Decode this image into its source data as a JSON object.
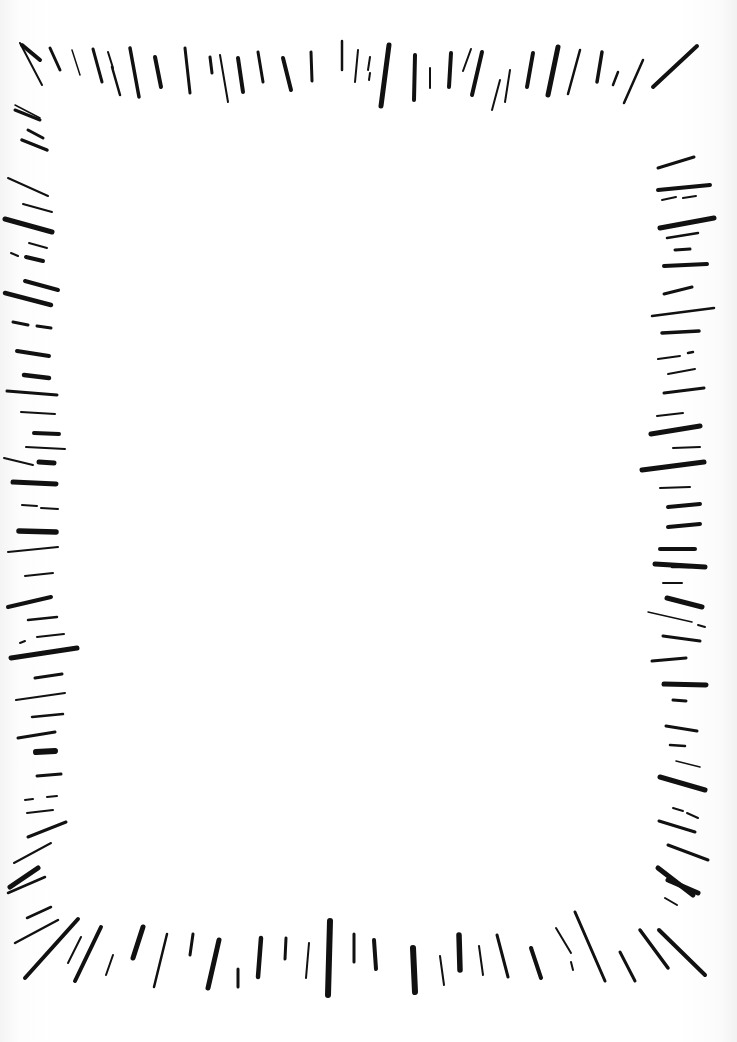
{
  "title": "Hand-drawn radial stroke frame",
  "colors": {
    "ink": "#111111",
    "paper": "#ffffff"
  },
  "frame": {
    "top": [
      [
        22,
        45,
        40,
        60,
        4
      ],
      [
        20,
        43,
        42,
        85,
        2
      ],
      [
        50,
        48,
        60,
        70,
        3
      ],
      [
        72,
        50,
        80,
        75,
        1.5
      ],
      [
        93,
        49,
        102,
        82,
        3
      ],
      [
        108,
        52,
        113,
        68,
        2
      ],
      [
        112,
        67,
        120,
        95,
        2.5
      ],
      [
        130,
        48,
        139,
        97,
        3.5
      ],
      [
        155,
        57,
        161,
        87,
        4
      ],
      [
        185,
        48,
        190,
        93,
        3
      ],
      [
        210,
        57,
        212,
        73,
        3
      ],
      [
        220,
        55,
        228,
        102,
        2
      ],
      [
        238,
        58,
        243,
        92,
        4
      ],
      [
        258,
        52,
        263,
        82,
        3
      ],
      [
        283,
        58,
        291,
        90,
        4
      ],
      [
        311,
        52,
        312,
        81,
        3
      ],
      [
        342,
        41,
        342,
        70,
        2.5
      ],
      [
        358,
        50,
        355,
        82,
        2
      ],
      [
        370,
        57,
        368,
        70,
        2
      ],
      [
        370,
        73,
        369,
        80,
        2
      ],
      [
        389,
        45,
        381,
        106,
        5
      ],
      [
        415,
        55,
        414,
        100,
        4
      ],
      [
        430,
        68,
        430,
        88,
        2
      ],
      [
        451,
        53,
        449,
        87,
        4
      ],
      [
        471,
        49,
        463,
        71,
        2
      ],
      [
        482,
        52,
        472,
        95,
        4
      ],
      [
        500,
        80,
        492,
        110,
        2
      ],
      [
        510,
        70,
        505,
        102,
        2
      ],
      [
        533,
        53,
        527,
        87,
        4
      ],
      [
        558,
        47,
        548,
        95,
        5
      ],
      [
        580,
        50,
        568,
        94,
        2.5
      ],
      [
        602,
        52,
        597,
        82,
        3.5
      ],
      [
        618,
        72,
        613,
        85,
        2.5
      ],
      [
        643,
        60,
        624,
        103,
        2.5
      ],
      [
        697,
        46,
        653,
        87,
        4
      ]
    ],
    "left": [
      [
        15,
        105,
        40,
        118,
        1.5
      ],
      [
        15,
        110,
        40,
        120,
        3
      ],
      [
        28,
        130,
        43,
        138,
        3
      ],
      [
        22,
        140,
        47,
        150,
        3.5
      ],
      [
        8,
        178,
        48,
        196,
        2
      ],
      [
        23,
        204,
        52,
        212,
        2
      ],
      [
        5,
        219,
        52,
        232,
        5
      ],
      [
        29,
        243,
        47,
        248,
        2
      ],
      [
        11,
        253,
        18,
        256,
        2
      ],
      [
        26,
        257,
        43,
        261,
        4
      ],
      [
        25,
        281,
        58,
        290,
        4
      ],
      [
        5,
        293,
        51,
        305,
        4.5
      ],
      [
        13,
        322,
        28,
        325,
        3
      ],
      [
        37,
        326,
        51,
        328,
        3
      ],
      [
        17,
        351,
        49,
        356,
        4
      ],
      [
        24,
        375,
        49,
        378,
        4.5
      ],
      [
        7,
        391,
        57,
        395,
        3
      ],
      [
        21,
        412,
        55,
        414,
        2
      ],
      [
        34,
        433,
        59,
        434,
        4
      ],
      [
        26,
        447,
        65,
        449,
        2
      ],
      [
        4,
        458,
        33,
        465,
        2
      ],
      [
        39,
        462,
        54,
        463,
        5
      ],
      [
        13,
        482,
        56,
        484,
        5
      ],
      [
        22,
        505,
        37,
        506,
        2
      ],
      [
        41,
        508,
        58,
        509,
        2
      ],
      [
        19,
        531,
        56,
        532,
        5.5
      ],
      [
        8,
        552,
        58,
        547,
        2
      ],
      [
        25,
        576,
        53,
        573,
        2
      ],
      [
        8,
        607,
        51,
        597,
        4
      ],
      [
        28,
        620,
        57,
        617,
        2.5
      ],
      [
        20,
        643,
        25,
        641,
        2
      ],
      [
        37,
        637,
        64,
        634,
        2
      ],
      [
        11,
        658,
        77,
        648,
        5
      ],
      [
        35,
        678,
        62,
        674,
        3
      ],
      [
        16,
        700,
        65,
        693,
        2
      ],
      [
        32,
        717,
        63,
        714,
        2.5
      ],
      [
        18,
        738,
        55,
        732,
        3
      ],
      [
        36,
        752,
        55,
        751,
        6
      ],
      [
        37,
        776,
        61,
        774,
        3
      ],
      [
        25,
        800,
        33,
        799,
        2
      ],
      [
        47,
        797,
        57,
        796,
        2
      ],
      [
        27,
        813,
        53,
        810,
        2
      ],
      [
        28,
        837,
        66,
        822,
        3
      ],
      [
        14,
        863,
        51,
        843,
        2
      ],
      [
        10,
        887,
        38,
        868,
        5
      ],
      [
        8,
        893,
        45,
        877,
        2.5
      ],
      [
        27,
        918,
        51,
        907,
        2.5
      ],
      [
        15,
        943,
        58,
        920,
        2.5
      ]
    ],
    "left_bottom": [
      [
        25,
        978,
        78,
        919,
        4
      ],
      [
        68,
        963,
        81,
        937,
        2
      ],
      [
        75,
        981,
        101,
        927,
        4
      ],
      [
        106,
        975,
        113,
        955,
        2
      ],
      [
        133,
        958,
        143,
        927,
        5
      ],
      [
        154,
        987,
        167,
        934,
        2.5
      ],
      [
        190,
        955,
        193,
        934,
        3
      ],
      [
        208,
        988,
        219,
        940,
        5
      ],
      [
        238,
        987,
        238,
        969,
        3
      ],
      [
        258,
        977,
        261,
        938,
        4.5
      ],
      [
        285,
        959,
        286,
        938,
        3
      ],
      [
        306,
        978,
        309,
        943,
        2
      ],
      [
        328,
        995,
        330,
        921,
        6
      ],
      [
        354,
        962,
        354,
        934,
        3
      ]
    ],
    "bottom_right": [
      [
        376,
        969,
        374,
        940,
        4
      ],
      [
        415,
        992,
        413,
        948,
        6
      ],
      [
        444,
        985,
        440,
        956,
        2
      ],
      [
        460,
        970,
        459,
        935,
        5.5
      ],
      [
        483,
        975,
        479,
        946,
        2
      ],
      [
        508,
        977,
        497,
        935,
        3
      ],
      [
        541,
        978,
        531,
        948,
        4
      ],
      [
        571,
        953,
        556,
        928,
        2
      ],
      [
        573,
        970,
        571,
        962,
        2
      ],
      [
        605,
        981,
        575,
        912,
        3
      ],
      [
        635,
        981,
        620,
        952,
        3
      ],
      [
        668,
        968,
        640,
        930,
        3.5
      ],
      [
        705,
        975,
        659,
        930,
        4
      ],
      [
        698,
        893,
        668,
        880,
        5
      ],
      [
        677,
        905,
        665,
        898,
        2
      ]
    ],
    "right": [
      [
        658,
        168,
        694,
        157,
        3
      ],
      [
        658,
        190,
        710,
        185,
        4
      ],
      [
        662,
        200,
        676,
        197,
        2
      ],
      [
        683,
        198,
        696,
        196,
        2
      ],
      [
        660,
        228,
        714,
        218,
        5
      ],
      [
        667,
        238,
        698,
        233,
        2.5
      ],
      [
        675,
        250,
        690,
        249,
        3
      ],
      [
        664,
        266,
        707,
        264,
        4
      ],
      [
        664,
        294,
        692,
        287,
        3
      ],
      [
        652,
        316,
        714,
        308,
        2.5
      ],
      [
        662,
        333,
        699,
        331,
        3.5
      ],
      [
        658,
        359,
        680,
        356,
        2
      ],
      [
        688,
        353,
        693,
        352,
        2.5
      ],
      [
        668,
        374,
        695,
        369,
        2
      ],
      [
        664,
        393,
        704,
        388,
        3
      ],
      [
        657,
        416,
        683,
        413,
        2
      ],
      [
        651,
        434,
        700,
        426,
        5
      ],
      [
        673,
        448,
        700,
        447,
        2
      ],
      [
        642,
        470,
        704,
        462,
        5
      ],
      [
        660,
        488,
        690,
        487,
        2
      ],
      [
        668,
        507,
        700,
        504,
        4
      ],
      [
        668,
        527,
        700,
        524,
        4
      ],
      [
        660,
        549,
        695,
        549,
        4
      ],
      [
        672,
        567,
        690,
        567,
        2.5
      ],
      [
        655,
        564,
        705,
        567,
        5
      ],
      [
        663,
        583,
        682,
        583,
        2
      ],
      [
        667,
        598,
        702,
        607,
        5
      ],
      [
        648,
        612,
        692,
        622,
        1.5
      ],
      [
        698,
        625,
        705,
        627,
        2
      ],
      [
        663,
        636,
        700,
        641,
        3
      ],
      [
        652,
        661,
        686,
        658,
        3
      ],
      [
        664,
        684,
        706,
        685,
        5
      ],
      [
        673,
        700,
        686,
        701,
        3
      ],
      [
        666,
        726,
        697,
        731,
        3
      ],
      [
        670,
        745,
        685,
        746,
        2.5
      ],
      [
        676,
        761,
        700,
        767,
        1.5
      ],
      [
        660,
        777,
        705,
        790,
        5
      ],
      [
        673,
        808,
        683,
        811,
        2
      ],
      [
        687,
        813,
        698,
        818,
        2
      ],
      [
        659,
        821,
        695,
        832,
        3
      ],
      [
        668,
        845,
        708,
        860,
        3
      ],
      [
        658,
        868,
        693,
        895,
        5
      ]
    ]
  }
}
